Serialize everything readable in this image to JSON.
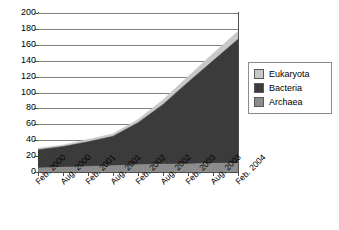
{
  "chart_data": {
    "type": "area",
    "stacked": true,
    "title": "",
    "xlabel": "",
    "ylabel": "",
    "ylim": [
      0,
      200
    ],
    "ytick_step": 20,
    "yticks": [
      200,
      180,
      160,
      140,
      120,
      100,
      80,
      60,
      40,
      20,
      0
    ],
    "grid": true,
    "legend_position": "right",
    "categories": [
      "Feb. 2000",
      "Aug. 2000",
      "Feb. 2001",
      "Aug. 2001",
      "Feb. 2002",
      "Aug. 2002",
      "Feb. 2003",
      "Aug. 2003",
      "Feb. 2004"
    ],
    "series": [
      {
        "name": "Archaea",
        "color": "#8c8c8c",
        "values": [
          5,
          6,
          7,
          8,
          9,
          10,
          10,
          11,
          11
        ]
      },
      {
        "name": "Bacteria",
        "color": "#3b3b3b",
        "values": [
          23,
          26,
          31,
          37,
          53,
          75,
          103,
          129,
          156
        ]
      },
      {
        "name": "Eukaryota",
        "color": "#c8c8c8",
        "values": [
          2,
          2,
          3,
          3,
          4,
          6,
          7,
          9,
          10
        ]
      }
    ],
    "totals": [
      30,
      34,
      41,
      48,
      66,
      91,
      120,
      149,
      177
    ],
    "cumulative_upper": {
      "archaea": [
        5,
        6,
        7,
        8,
        9,
        10,
        10,
        11,
        11
      ],
      "bacteria": [
        28,
        32,
        38,
        45,
        62,
        85,
        113,
        140,
        167
      ],
      "eukaryota": [
        30,
        34,
        41,
        48,
        66,
        91,
        120,
        149,
        177
      ]
    }
  },
  "legend": {
    "items": [
      {
        "label": "Eukaryota",
        "color": "#c8c8c8"
      },
      {
        "label": "Bacteria",
        "color": "#3b3b3b"
      },
      {
        "label": "Archaea",
        "color": "#8c8c8c"
      }
    ]
  },
  "axes": {
    "y_labels": [
      "200",
      "180",
      "160",
      "140",
      "120",
      "100",
      "80",
      "60",
      "40",
      "20",
      "0"
    ],
    "x_labels": [
      "Feb. 2000",
      "Aug. 2000",
      "Feb. 2001",
      "Aug. 2001",
      "Feb. 2002",
      "Aug. 2002",
      "Feb. 2003",
      "Aug. 2003",
      "Feb. 2004"
    ]
  },
  "colors": {
    "axis": "#4d4d4d",
    "grid": "#808080",
    "archaea": "#8c8c8c",
    "bacteria": "#3b3b3b",
    "eukaryota": "#c8c8c8",
    "background": "#ffffff"
  }
}
